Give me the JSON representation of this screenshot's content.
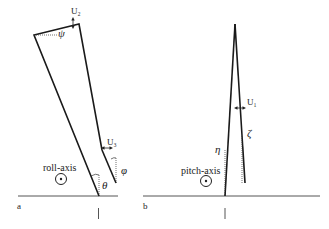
{
  "panels": [
    {
      "id": "a",
      "panel_label": "a",
      "axis_label": "roll-axis",
      "labels": {
        "u2": "U₂",
        "u3": "U₃",
        "psi": "ψ",
        "theta": "θ",
        "phi": "φ"
      }
    },
    {
      "id": "b",
      "panel_label": "b",
      "axis_label": "pitch-axis",
      "labels": {
        "u1": "U₁",
        "eta": "η",
        "zeta": "ζ"
      }
    }
  ],
  "colors": {
    "stroke": "#1a1a1a",
    "ground": "#555555",
    "background": "#ffffff"
  }
}
